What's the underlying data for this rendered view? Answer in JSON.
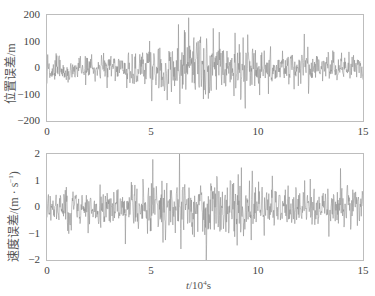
{
  "chart_data": [
    {
      "type": "line",
      "title": "",
      "xlabel": "t/10^4 s",
      "ylabel": "位置误差/m",
      "xlim": [
        0,
        15
      ],
      "ylim": [
        -200,
        200
      ],
      "xticks": [
        0,
        5,
        10,
        15
      ],
      "yticks": [
        -200,
        -100,
        0,
        100,
        200
      ],
      "grid": false,
      "legend": null,
      "series": [
        {
          "name": "position error",
          "color": "#8a8a8a",
          "description": "dense zero-mean noise; amplitude ~±80 m for t<4.5, grows to ±200 m (clipped) for 5<t<10, ~±100 m for t>10",
          "envelope": [
            {
              "t": 0,
              "amp": 90
            },
            {
              "t": 2,
              "amp": 85
            },
            {
              "t": 4,
              "amp": 100
            },
            {
              "t": 5,
              "amp": 170
            },
            {
              "t": 6.5,
              "amp": 220
            },
            {
              "t": 7.5,
              "amp": 230
            },
            {
              "t": 9,
              "amp": 200
            },
            {
              "t": 10,
              "amp": 150
            },
            {
              "t": 11,
              "amp": 110
            },
            {
              "t": 13,
              "amp": 100
            },
            {
              "t": 15,
              "amp": 90
            }
          ],
          "num_samples": 900,
          "seed": 7
        }
      ]
    },
    {
      "type": "line",
      "title": "",
      "xlabel": "t/10^4 s",
      "ylabel": "速度误差/(m·s^-1)",
      "xlim": [
        0,
        15
      ],
      "ylim": [
        -2,
        2
      ],
      "xticks": [
        0,
        5,
        10,
        15
      ],
      "yticks": [
        -2,
        -1,
        0,
        1,
        2
      ],
      "grid": false,
      "legend": null,
      "series": [
        {
          "name": "velocity error",
          "color": "#8a8a8a",
          "description": "dense zero-mean noise; amplitude ~±1.2 m/s early, up to ±2 (clipped) near t=6–10, ~±1.2 late",
          "envelope": [
            {
              "t": 0,
              "amp": 1.2
            },
            {
              "t": 2,
              "amp": 1.2
            },
            {
              "t": 4,
              "amp": 1.3
            },
            {
              "t": 5,
              "amp": 1.6
            },
            {
              "t": 6.5,
              "amp": 2.1
            },
            {
              "t": 8,
              "amp": 2.2
            },
            {
              "t": 9.5,
              "amp": 2.0
            },
            {
              "t": 10.5,
              "amp": 1.4
            },
            {
              "t": 12,
              "amp": 1.3
            },
            {
              "t": 15,
              "amp": 1.2
            }
          ],
          "num_samples": 900,
          "seed": 19
        }
      ]
    }
  ],
  "labels": {
    "top": {
      "ylabel": "位置误差/m",
      "yticks": [
        "200",
        "100",
        "0",
        "−100",
        "−200"
      ],
      "xticks": [
        "0",
        "5",
        "10",
        "15"
      ]
    },
    "bottom": {
      "ylabel_main": "速度误差/(m · s",
      "ylabel_sup": "−1",
      "ylabel_end": ")",
      "yticks": [
        "2",
        "1",
        "0",
        "−1",
        "−2"
      ],
      "xticks": [
        "0",
        "5",
        "10",
        "15"
      ]
    },
    "xlabel": {
      "var": "t",
      "unit_prefix": "/10",
      "exp": "4",
      "unit": "s"
    }
  }
}
